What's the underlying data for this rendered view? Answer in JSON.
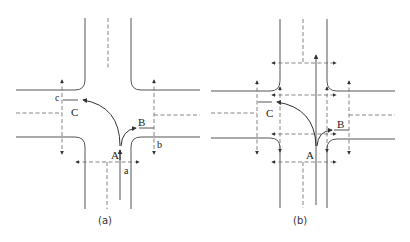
{
  "figure": {
    "panels": [
      {
        "id": "a",
        "caption": "(a)",
        "points": {
          "A": "A",
          "B": "B",
          "C": "C"
        },
        "crosswalk_labels": {
          "a": "a",
          "b": "b",
          "c": "c"
        }
      },
      {
        "id": "b",
        "caption": "(b)",
        "points": {
          "A": "A",
          "B": "B",
          "C": "C"
        }
      }
    ]
  },
  "colors": {
    "line": "#555555",
    "dash": "#666666",
    "text": "#222222",
    "background": "#ffffff"
  }
}
